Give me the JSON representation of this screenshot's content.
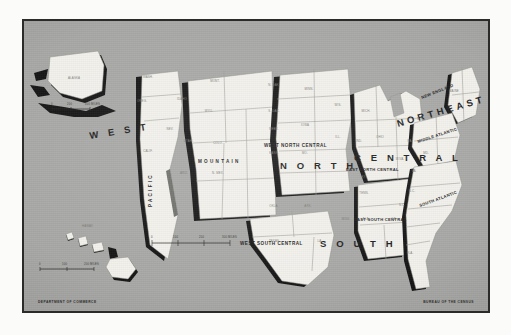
{
  "plate": {
    "background_color": "#a8a8a6",
    "border_color": "#2b2b2b",
    "land_color": "#f2f1ec",
    "shadow_color": "#141414"
  },
  "credits": {
    "left": "DEPARTMENT OF COMMERCE",
    "right": "BUREAU OF THE CENSUS"
  },
  "regions": [
    {
      "id": "west",
      "label": "W  E  S  T",
      "kind": "major"
    },
    {
      "id": "north",
      "label": "N O R T H",
      "kind": "major"
    },
    {
      "id": "central",
      "label": "C E N T R A L",
      "kind": "major"
    },
    {
      "id": "northeast",
      "label": "NORTHEAST",
      "kind": "major"
    },
    {
      "id": "south",
      "label": "S  O  U  T  H",
      "kind": "major"
    }
  ],
  "divisions": [
    {
      "id": "pacific",
      "label": "P A C I F I C",
      "orientation": "vertical"
    },
    {
      "id": "mountain",
      "label": "M O U N T A I N",
      "orientation": "horizontal"
    },
    {
      "id": "west-north-central",
      "label": "WEST NORTH CENTRAL",
      "orientation": "horizontal"
    },
    {
      "id": "east-north-central",
      "label": "EAST NORTH CENTRAL",
      "orientation": "horizontal"
    },
    {
      "id": "new-england",
      "label": "NEW ENGLAND",
      "orientation": "diagonal"
    },
    {
      "id": "middle-atlantic",
      "label": "MIDDLE ATLANTIC",
      "orientation": "diagonal"
    },
    {
      "id": "west-south-central",
      "label": "WEST SOUTH CENTRAL",
      "orientation": "horizontal"
    },
    {
      "id": "east-south-central",
      "label": "EAST SOUTH CENTRAL",
      "orientation": "horizontal"
    },
    {
      "id": "south-atlantic",
      "label": "SOUTH ATLANTIC",
      "orientation": "diagonal"
    }
  ],
  "insets": [
    {
      "id": "alaska",
      "label": "ALASKA",
      "scale_labels": [
        "0",
        "200",
        "400 MILES"
      ]
    },
    {
      "id": "hawaii",
      "label": "HAWAII",
      "scale_labels": [
        "0",
        "100",
        "200 MILES"
      ]
    }
  ],
  "main_scale": {
    "labels": [
      "0",
      "100",
      "200",
      "300 MILES"
    ]
  },
  "states": [
    {
      "ab": "WASH.",
      "x": 146,
      "y": 76
    },
    {
      "ab": "OREG.",
      "x": 140,
      "y": 100
    },
    {
      "ab": "IDAHO",
      "x": 180,
      "y": 98
    },
    {
      "ab": "MONT.",
      "x": 213,
      "y": 80
    },
    {
      "ab": "N. DAK.",
      "x": 272,
      "y": 84
    },
    {
      "ab": "MINN.",
      "x": 307,
      "y": 88
    },
    {
      "ab": "S. DAK.",
      "x": 272,
      "y": 110
    },
    {
      "ab": "WYO.",
      "x": 207,
      "y": 110
    },
    {
      "ab": "NEV.",
      "x": 168,
      "y": 128
    },
    {
      "ab": "CALIF.",
      "x": 146,
      "y": 150
    },
    {
      "ab": "UTAH",
      "x": 186,
      "y": 140
    },
    {
      "ab": "COLO.",
      "x": 216,
      "y": 142
    },
    {
      "ab": "NEBR.",
      "x": 272,
      "y": 128
    },
    {
      "ab": "IOWA",
      "x": 303,
      "y": 124
    },
    {
      "ab": "KANS.",
      "x": 272,
      "y": 152
    },
    {
      "ab": "MO.",
      "x": 303,
      "y": 152
    },
    {
      "ab": "ARIZ.",
      "x": 182,
      "y": 172
    },
    {
      "ab": "N. MEX.",
      "x": 216,
      "y": 172
    },
    {
      "ab": "OKLA.",
      "x": 272,
      "y": 205
    },
    {
      "ab": "ARK.",
      "x": 306,
      "y": 205
    },
    {
      "ab": "TEXAS",
      "x": 272,
      "y": 240
    },
    {
      "ab": "WIS.",
      "x": 336,
      "y": 104
    },
    {
      "ab": "ILL.",
      "x": 336,
      "y": 136
    },
    {
      "ab": "MICH.",
      "x": 364,
      "y": 110
    },
    {
      "ab": "IND.",
      "x": 357,
      "y": 140
    },
    {
      "ab": "OHIO",
      "x": 378,
      "y": 136
    },
    {
      "ab": "KY.",
      "x": 362,
      "y": 176
    },
    {
      "ab": "TENN.",
      "x": 362,
      "y": 192
    },
    {
      "ab": "MISS.",
      "x": 344,
      "y": 218
    },
    {
      "ab": "ALA.",
      "x": 364,
      "y": 218
    },
    {
      "ab": "LA.",
      "x": 318,
      "y": 240
    },
    {
      "ab": "W.VA.",
      "x": 398,
      "y": 158
    },
    {
      "ab": "VA.",
      "x": 412,
      "y": 170
    },
    {
      "ab": "N.C.",
      "x": 410,
      "y": 190
    },
    {
      "ab": "S.C.",
      "x": 400,
      "y": 204
    },
    {
      "ab": "GA.",
      "x": 392,
      "y": 218
    },
    {
      "ab": "FLA.",
      "x": 408,
      "y": 252
    },
    {
      "ab": "PA.",
      "x": 408,
      "y": 140
    },
    {
      "ab": "N.Y.",
      "x": 418,
      "y": 118
    },
    {
      "ab": "MD.",
      "x": 424,
      "y": 152
    },
    {
      "ab": "MAINE",
      "x": 452,
      "y": 90
    }
  ]
}
